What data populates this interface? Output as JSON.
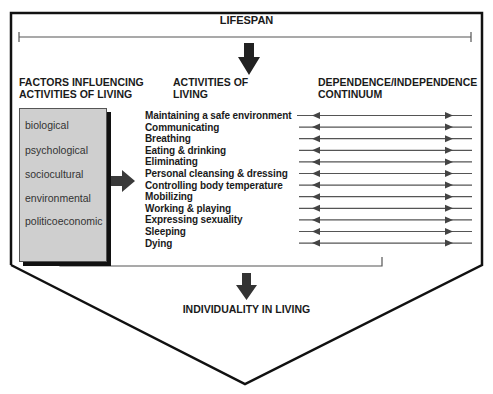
{
  "diagram": {
    "lifespan_label": "LIFESPAN",
    "factors_heading": [
      "FACTORS INFLUENCING",
      "ACTIVITIES OF LIVING"
    ],
    "activities_heading": [
      "ACTIVITIES OF",
      "LIVING"
    ],
    "continuum_heading": [
      "DEPENDENCE/INDEPENDENCE",
      "CONTINUUM"
    ],
    "factors": [
      "biological",
      "psychological",
      "sociocultural",
      "environmental",
      "politicoeconomic"
    ],
    "activities": [
      "Maintaining a safe environment",
      "Communicating",
      "Breathing",
      "Eating & drinking",
      "Eliminating",
      "Personal cleansing & dressing",
      "Controlling body temperature",
      "Mobilizing",
      "Working & playing",
      "Expressing sexuality",
      "Sleeping",
      "Dying"
    ],
    "outcome_label": "INDIVIDUALITY IN LIVING",
    "colors": {
      "line": "#111111",
      "connector": "#444444",
      "factor_box": "#cfcfcf",
      "arrow": "#333333"
    }
  }
}
